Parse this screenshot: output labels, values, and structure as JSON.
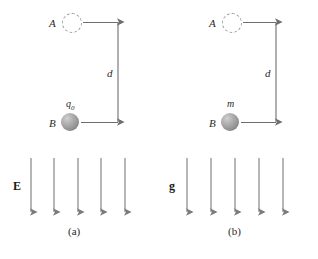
{
  "figure": {
    "background_color": "#ffffff",
    "arrow_color": "#6e6e6e",
    "label_color": "#2a2a2a",
    "sphere_color": "#9a9a9a",
    "dashed_circle_color": "#9a9a9a"
  },
  "panels": [
    {
      "id": "a",
      "caption": "(a)",
      "point_top_label": "A",
      "point_bottom_label": "B",
      "object_label": "q",
      "object_label_sub": "0",
      "distance_label": "d",
      "field_label": "E",
      "field_arrow_count": 5,
      "field_direction": "down"
    },
    {
      "id": "b",
      "caption": "(b)",
      "point_top_label": "A",
      "point_bottom_label": "B",
      "object_label": "m",
      "object_label_sub": "",
      "distance_label": "d",
      "field_label": "g",
      "field_arrow_count": 5,
      "field_direction": "down"
    }
  ]
}
